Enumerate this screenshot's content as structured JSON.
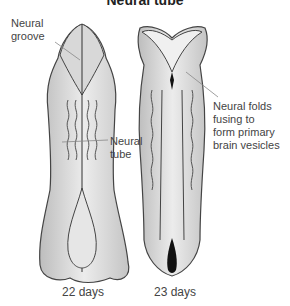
{
  "title": "Neural tube",
  "labels": {
    "neural_groove": "Neural\ngroove",
    "neural_tube": "Neural\ntube",
    "neural_folds": "Neural folds\nfusing to\nform primary\nbrain vesicles"
  },
  "captions": {
    "left": "22 days",
    "right": "23 days"
  }
}
